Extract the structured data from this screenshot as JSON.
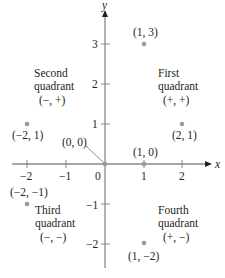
{
  "diagram": {
    "type": "cartesian-plane-quadrants",
    "axes": {
      "x_label": "x",
      "y_label": "y",
      "x_ticks": [
        {
          "value": -2,
          "label": "−2"
        },
        {
          "value": -1,
          "label": "−1"
        },
        {
          "value": 0,
          "label": "0"
        },
        {
          "value": 1,
          "label": "1"
        },
        {
          "value": 2,
          "label": "2"
        }
      ],
      "y_ticks": [
        {
          "value": 3,
          "label": "3"
        },
        {
          "value": 2,
          "label": "2"
        },
        {
          "value": 1,
          "label": "1"
        },
        {
          "value": -1,
          "label": "−1"
        },
        {
          "value": -2,
          "label": "−2"
        }
      ],
      "axis_color": "#8a8a8a"
    },
    "points": [
      {
        "x": 1,
        "y": 3,
        "label": "(1, 3)"
      },
      {
        "x": -2,
        "y": 1,
        "label": "(−2, 1)"
      },
      {
        "x": 2,
        "y": 1,
        "label": "(2, 1)"
      },
      {
        "x": 0,
        "y": 0,
        "label": "(0, 0)"
      },
      {
        "x": 1,
        "y": 0,
        "label": "(1, 0)"
      },
      {
        "x": -2,
        "y": -1,
        "label": "(−2, −1)"
      },
      {
        "x": 1,
        "y": -2,
        "label": "(1, −2)"
      }
    ],
    "point_color": "#9a9a9a",
    "quadrants": {
      "first": {
        "name": "First",
        "word": "quadrant",
        "signs": "(+, +)"
      },
      "second": {
        "name": "Second",
        "word": "quadrant",
        "signs": "(−, +)"
      },
      "third": {
        "name": "Third",
        "word": "quadrant",
        "signs": "(−, −)"
      },
      "fourth": {
        "name": "Fourth",
        "word": "quadrant",
        "signs": "(+, −)"
      }
    }
  }
}
